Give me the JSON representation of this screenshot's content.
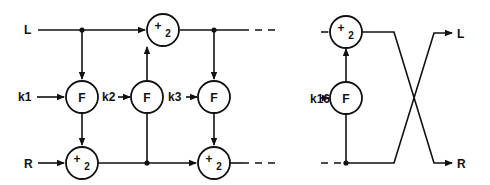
{
  "diagram": {
    "title": "",
    "inputs": {
      "left": "L",
      "right": "R"
    },
    "outputs": {
      "left": "L",
      "right": "R"
    },
    "keys": [
      "k1",
      "k2",
      "k3",
      "k16"
    ],
    "function_label": "F",
    "adder": {
      "symbol": "+",
      "subscript": "2"
    },
    "stages_shown": [
      {
        "key": "k1",
        "reads_from": "L",
        "xors_into": "R"
      },
      {
        "key": "k2",
        "reads_from": "R",
        "xors_into": "L"
      },
      {
        "key": "k3",
        "reads_from": "L",
        "xors_into": "R"
      },
      {
        "key": "k16",
        "reads_from": "R",
        "xors_into": "L",
        "final": true
      }
    ],
    "continuation": "dashed lines indicate omitted rounds",
    "final_swap": true,
    "colors": {
      "stroke": "#111111",
      "background": "#ffffff"
    }
  }
}
